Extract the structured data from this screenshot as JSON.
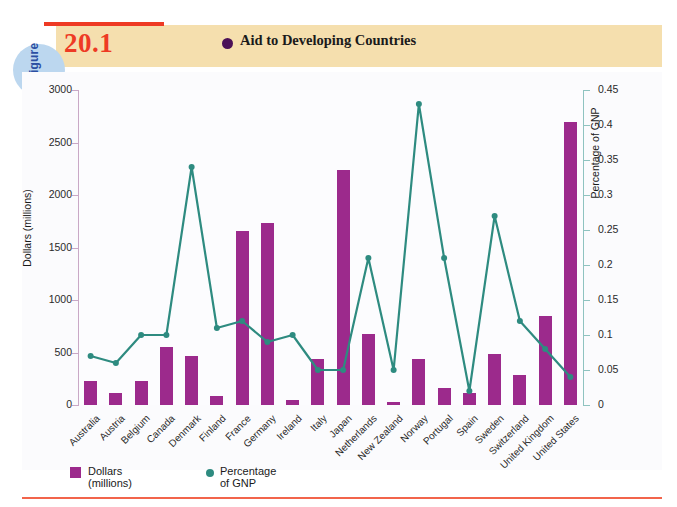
{
  "figure": {
    "word": "figure",
    "number": "20.1",
    "title": "Aid to Developing Countries",
    "accent_red": "#ee3a24",
    "band_color": "#f5dfae",
    "circle_color": "#bcd7ef",
    "title_dot_color": "#4b1057"
  },
  "legend": {
    "bar_label": "Dollars (millions)",
    "line_label": "Percentage of GNP",
    "bar_color": "#9c2a8c",
    "line_color": "#2e8b80"
  },
  "chart_data": {
    "type": "bar",
    "title": "Aid to Developing Countries",
    "xlabel": "",
    "ylabel": "Dollars (millions)",
    "y2label": "Percentage of GNP",
    "ylim": [
      0,
      3000
    ],
    "y2lim": [
      0,
      0.45
    ],
    "yticks": [
      0,
      500,
      1000,
      1500,
      2000,
      2500,
      3000
    ],
    "y2ticks": [
      0,
      0.05,
      0.1,
      0.15,
      0.2,
      0.25,
      0.3,
      0.35,
      0.4,
      0.45
    ],
    "ytick_labels": [
      "0",
      "500",
      "1000",
      "1500",
      "2000",
      "2500",
      "3000"
    ],
    "y2tick_labels": [
      "0",
      "0.05",
      "0.1",
      "0.15",
      "0.2",
      "0.25",
      "0.3",
      "0.35",
      "0.4",
      "0.45"
    ],
    "grid": false,
    "legend_position": "bottom-left",
    "categories": [
      "Australia",
      "Austria",
      "Belgium",
      "Canada",
      "Denmark",
      "Finland",
      "France",
      "Germany",
      "Ireland",
      "Italy",
      "Japan",
      "Netherlands",
      "New Zealand",
      "Norway",
      "Portugal",
      "Spain",
      "Sweden",
      "Switzerland",
      "United Kingdom",
      "United States"
    ],
    "series": [
      {
        "name": "Dollars (millions)",
        "axis": "left",
        "type": "bar",
        "color": "#9c2a8c",
        "values": [
          225,
          110,
          225,
          550,
          470,
          90,
          1660,
          1730,
          45,
          440,
          2240,
          680,
          25,
          440,
          165,
          110,
          485,
          285,
          845,
          2700
        ]
      },
      {
        "name": "Percentage of GNP",
        "axis": "right",
        "type": "line",
        "color": "#2e8b80",
        "values": [
          0.07,
          0.06,
          0.1,
          0.1,
          0.34,
          0.11,
          0.12,
          0.09,
          0.1,
          0.05,
          0.05,
          0.21,
          0.05,
          0.43,
          0.21,
          0.02,
          0.27,
          0.12,
          0.08,
          0.04
        ]
      }
    ]
  }
}
